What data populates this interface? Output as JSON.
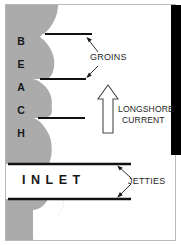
{
  "figure": {
    "type": "cross-shore plan view schematic"
  },
  "colors": {
    "sand": "#ababab",
    "water": "#ffffff",
    "structure": "#1a1a1a",
    "border": "#b5b5b5",
    "black_bar": "#000000",
    "text": "#1a1a1a"
  },
  "labels": {
    "beach": "BEACH",
    "beach_letters": [
      "B",
      "E",
      "A",
      "C",
      "H"
    ],
    "inlet": "INLET",
    "groins": "GROINS",
    "longshore_line1": "LONGSHORE",
    "longshore_line2": "CURRENT",
    "jetties": "JETTIES"
  },
  "features": {
    "groin_count": 3,
    "jetty_count": 2,
    "current_direction": "up",
    "shoreline": "scalloped / updrift accretion and downdrift erosion"
  },
  "icons": {
    "current_arrow": "hollow-up-arrow",
    "groin_pointer": "leader-arrow",
    "jetty_pointer": "leader-arrow"
  }
}
